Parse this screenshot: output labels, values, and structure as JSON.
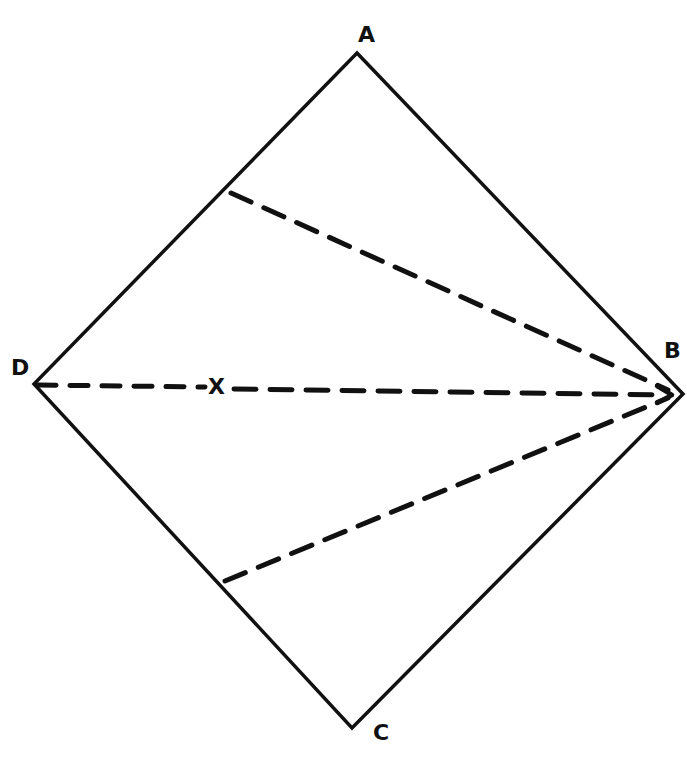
{
  "diagram": {
    "type": "rhombus-with-dashed-rays",
    "stroke_color": "#111111",
    "background": "#ffffff",
    "vertices": {
      "A": {
        "label": "A",
        "x": 357,
        "y": 53
      },
      "B": {
        "label": "B",
        "x": 683,
        "y": 394
      },
      "C": {
        "label": "C",
        "x": 352,
        "y": 728
      },
      "D": {
        "label": "D",
        "x": 34,
        "y": 384
      }
    },
    "dashed_lines": [
      {
        "from": [
          231,
          193
        ],
        "to": [
          670,
          394
        ],
        "note": "from side AD to B"
      },
      {
        "from": [
          34,
          384
        ],
        "to": [
          670,
          394
        ],
        "note": "from D to B with arrow"
      },
      {
        "from": [
          225,
          581
        ],
        "to": [
          670,
          394
        ],
        "note": "from side DC to B"
      }
    ],
    "point_X": {
      "label": "X",
      "x": 218,
      "y": 388
    }
  }
}
